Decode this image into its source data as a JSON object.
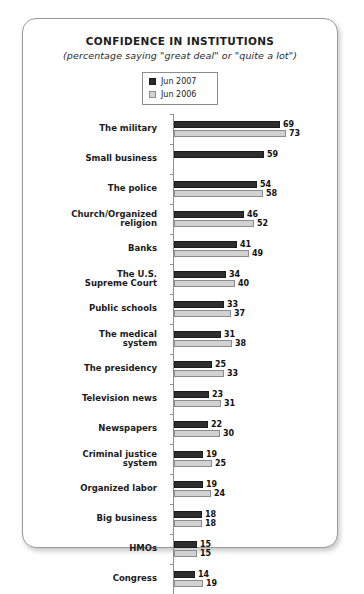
{
  "chart_data": {
    "type": "bar",
    "orientation": "horizontal",
    "title": "CONFIDENCE IN INSTITUTIONS",
    "subtitle": "(percentage saying \"great deal\" or \"quite a lot\")",
    "xlabel": "",
    "ylabel": "",
    "xlim": [
      0,
      80
    ],
    "grid": false,
    "legend_position": "top-center",
    "colors": {
      "jun_2007": "#2e2e2e",
      "jun_2006": "#d2d2d2",
      "panel_border": "#9a9a9a",
      "axis": "#8f8f8f"
    },
    "categories": [
      "The military",
      "Small business",
      "The police",
      "Church/Organized religion",
      "Banks",
      "The U.S. Supreme Court",
      "Public schools",
      "The medical system",
      "The presidency",
      "Television news",
      "Newspapers",
      "Criminal justice system",
      "Organized labor",
      "Big business",
      "HMOs",
      "Congress"
    ],
    "series": [
      {
        "name": "Jun 2007",
        "values": [
          69,
          59,
          54,
          46,
          41,
          34,
          33,
          31,
          25,
          23,
          22,
          19,
          19,
          18,
          15,
          14
        ]
      },
      {
        "name": "Jun 2006",
        "values": [
          73,
          null,
          58,
          52,
          49,
          40,
          37,
          38,
          33,
          31,
          30,
          25,
          24,
          18,
          15,
          19
        ]
      }
    ]
  },
  "legend": {
    "items": [
      {
        "label": "Jun 2007"
      },
      {
        "label": "Jun 2006"
      }
    ]
  },
  "rows": [
    {
      "label_lines": [
        "The military"
      ],
      "v2007": 69,
      "v2006": 73
    },
    {
      "label_lines": [
        "Small business"
      ],
      "v2007": 59,
      "v2006": null
    },
    {
      "label_lines": [
        "The police"
      ],
      "v2007": 54,
      "v2006": 58
    },
    {
      "label_lines": [
        "Church/Organized",
        "religion"
      ],
      "v2007": 46,
      "v2006": 52
    },
    {
      "label_lines": [
        "Banks"
      ],
      "v2007": 41,
      "v2006": 49
    },
    {
      "label_lines": [
        "The U.S.",
        "Supreme Court"
      ],
      "v2007": 34,
      "v2006": 40
    },
    {
      "label_lines": [
        "Public schools"
      ],
      "v2007": 33,
      "v2006": 37
    },
    {
      "label_lines": [
        "The medical",
        "system"
      ],
      "v2007": 31,
      "v2006": 38
    },
    {
      "label_lines": [
        "The presidency"
      ],
      "v2007": 25,
      "v2006": 33
    },
    {
      "label_lines": [
        "Television news"
      ],
      "v2007": 23,
      "v2006": 31
    },
    {
      "label_lines": [
        "Newspapers"
      ],
      "v2007": 22,
      "v2006": 30
    },
    {
      "label_lines": [
        "Criminal justice",
        "system"
      ],
      "v2007": 19,
      "v2006": 25
    },
    {
      "label_lines": [
        "Organized labor"
      ],
      "v2007": 19,
      "v2006": 24
    },
    {
      "label_lines": [
        "Big business"
      ],
      "v2007": 18,
      "v2006": 18
    },
    {
      "label_lines": [
        "HMOs"
      ],
      "v2007": 15,
      "v2006": 15
    },
    {
      "label_lines": [
        "Congress"
      ],
      "v2007": 14,
      "v2006": 19
    }
  ],
  "scale": {
    "px_per_unit": 1.53
  }
}
